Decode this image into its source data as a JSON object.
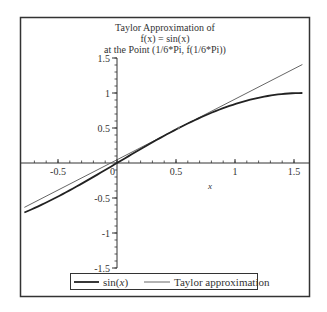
{
  "chart_data": {
    "type": "line",
    "title": "Taylor Approximation of\nf(x) = sin(x)\nat the Point (1/6*Pi, f(1/6*Pi))",
    "title_lines": [
      "Taylor Approximation of",
      "f(x) = sin(x)",
      "at the Point (1/6*Pi, f(1/6*Pi))"
    ],
    "xlabel": "x",
    "ylabel": "",
    "xlim": [
      -0.785,
      1.571
    ],
    "ylim": [
      -1.5,
      1.5
    ],
    "x_ticks": [
      -0.5,
      0,
      0.5,
      1,
      1.5
    ],
    "x_tick_labels": [
      "-0.5",
      "0",
      "0.5",
      "1",
      "1.5"
    ],
    "y_ticks": [
      -1.5,
      -1,
      -0.5,
      0.5,
      1,
      1.5
    ],
    "y_tick_labels": [
      "-1.5",
      "-1",
      "-0.5",
      "0.5",
      "1",
      "1.5"
    ],
    "grid": false,
    "legend_position": "bottom",
    "expansion_point": {
      "x": 0.5236,
      "y": 0.5
    },
    "series": [
      {
        "name": "sin(x)",
        "style": "thick",
        "color": "#222222",
        "x": [
          -0.785,
          -0.5,
          -0.25,
          0,
          0.25,
          0.5,
          0.75,
          1.0,
          1.25,
          1.571
        ],
        "values": [
          -0.707,
          -0.479,
          -0.247,
          0,
          0.247,
          0.479,
          0.682,
          0.841,
          0.949,
          1.0
        ]
      },
      {
        "name": "Taylor approximation",
        "style": "thin",
        "color": "#555555",
        "x": [
          -0.785,
          1.571
        ],
        "values": [
          -0.634,
          1.407
        ]
      }
    ]
  },
  "legend": {
    "items": [
      {
        "label": "sin(x)",
        "label_fn": "sin(",
        "label_var": "x",
        "label_close": ")"
      },
      {
        "label": "Taylor approximation"
      }
    ]
  }
}
